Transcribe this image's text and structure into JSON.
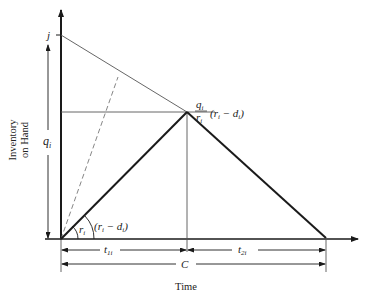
{
  "diagram": {
    "type": "inventory-cycle",
    "axes": {
      "y_label_line1": "Inventory",
      "y_label_line2": "on Hand",
      "x_label": "Time"
    },
    "labels": {
      "j": "j",
      "q": "q",
      "q_sub": "i",
      "peak_num": "q",
      "peak_num_sub": "i",
      "peak_den": "r",
      "peak_den_sub": "i",
      "peak_expr": "(r",
      "peak_expr_sub1": "i",
      "peak_expr_mid": " − d",
      "peak_expr_sub2": "i",
      "peak_expr_close": ")",
      "angle_r": "r",
      "angle_r_sub": "i",
      "angle_rd": "(r",
      "angle_rd_sub1": "i",
      "angle_rd_mid": " − d",
      "angle_rd_sub2": "i",
      "angle_rd_close": ")",
      "t1": "t",
      "t1_sub": "1i",
      "t2": "t",
      "t2_sub": "2i",
      "cycle": "C"
    },
    "colors": {
      "line": "#1a1a1a",
      "thin": "#555555",
      "dashed": "#777777"
    }
  }
}
